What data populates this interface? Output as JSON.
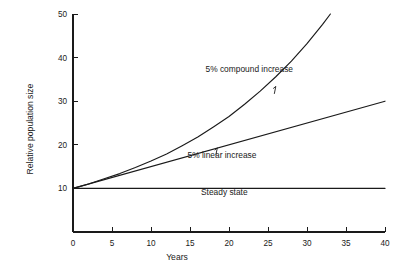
{
  "chart_data": {
    "type": "line",
    "title": "",
    "subtitle": "",
    "xlabel": "Years",
    "ylabel": "Relative population size",
    "xlim": [
      0,
      40
    ],
    "ylim": [
      0,
      50
    ],
    "grid": false,
    "legend_position": "inline-annotations",
    "x_ticks": [
      0,
      5,
      10,
      15,
      20,
      25,
      30,
      35,
      40
    ],
    "x_tick_labels": [
      "0",
      "5",
      "10",
      "15",
      "20",
      "25",
      "30",
      "35",
      "40"
    ],
    "y_ticks": [
      10,
      20,
      30,
      40,
      50
    ],
    "y_tick_labels": [
      "10",
      "20",
      "30",
      "40",
      "50"
    ],
    "series": [
      {
        "name": "5% compound increase",
        "formula": "10 * 1.05^t",
        "x": [
          0,
          2,
          4,
          6,
          8,
          10,
          12,
          14,
          16,
          18,
          20,
          22,
          24,
          26,
          28,
          30,
          32,
          33
        ],
        "values": [
          10.0,
          11.0,
          12.2,
          13.4,
          14.8,
          16.3,
          17.9,
          19.8,
          21.8,
          24.1,
          26.5,
          29.3,
          32.3,
          35.6,
          39.2,
          43.2,
          47.6,
          50.0
        ]
      },
      {
        "name": "5% linear increase",
        "formula": "10 + 0.5*t",
        "x": [
          0,
          40
        ],
        "values": [
          10.0,
          30.0
        ]
      },
      {
        "name": "Steady state",
        "formula": "10",
        "x": [
          0,
          40
        ],
        "values": [
          10.0,
          10.0
        ]
      }
    ],
    "annotations": [
      {
        "text": "5% compound increase",
        "label_x": 22.6,
        "label_y": 36.6,
        "pointer_to_x": 26.0,
        "pointer_to_y": 33.4
      },
      {
        "text": "5% linear increase",
        "label_x": 19.1,
        "label_y": 17.0,
        "pointer_to_x": 18.5,
        "pointer_to_y": 19.3
      },
      {
        "text": "Steady state",
        "label_x": 19.4,
        "label_y": 8.6,
        "pointer_to_x": null,
        "pointer_to_y": null
      }
    ]
  },
  "colors": {
    "ink": "#1a1a1a",
    "background": "#ffffff"
  }
}
